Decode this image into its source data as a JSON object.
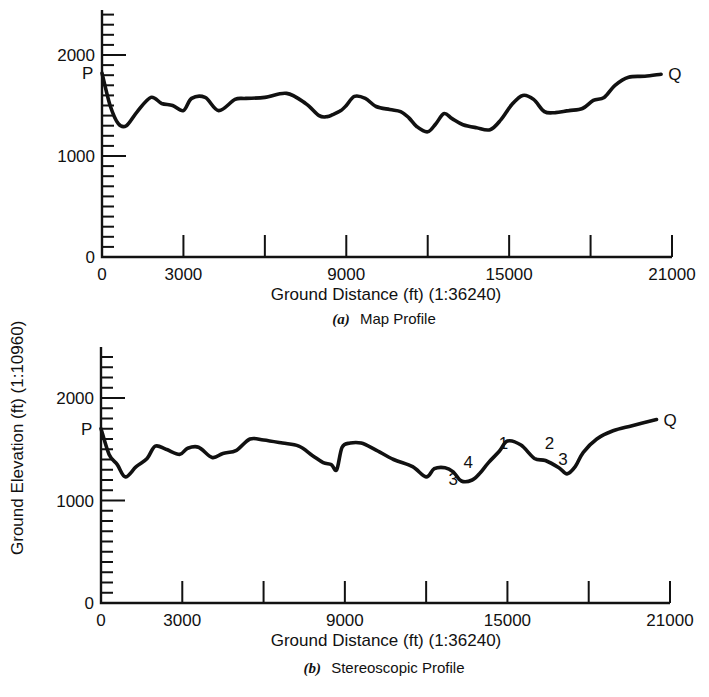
{
  "y_axis_title": "Ground Elevation (ft) (1:10960)",
  "chart_data": [
    {
      "type": "line",
      "panel": "a",
      "caption_letter": "(a)",
      "caption_text": "Map Profile",
      "xlabel": "Ground Distance (ft) (1:36240)",
      "ylabel": "Ground Elevation (ft) (1:10960)",
      "xlim": [
        0,
        21000
      ],
      "ylim": [
        0,
        2400
      ],
      "x_tick_labels": [
        "0",
        "3000",
        "9000",
        "15000",
        "21000"
      ],
      "x_tick_label_values": [
        0,
        3000,
        9000,
        15000,
        21000
      ],
      "x_major_ticks": [
        3000,
        6000,
        9000,
        12000,
        15000,
        18000,
        21000
      ],
      "y_tick_labels": [
        "0",
        "1000",
        "2000"
      ],
      "y_tick_label_values": [
        0,
        1000,
        2000
      ],
      "y_minor_step": 100,
      "grid": false,
      "start_label": "P",
      "end_label": "Q",
      "annotations": [],
      "x": [
        0,
        300,
        600,
        900,
        1300,
        1800,
        2200,
        2600,
        3000,
        3300,
        3800,
        4300,
        4900,
        5300,
        6000,
        6800,
        7500,
        8000,
        8300,
        8500,
        8800,
        9000,
        9300,
        9700,
        10100,
        10600,
        11000,
        11300,
        11600,
        12000,
        12300,
        12600,
        12900,
        13300,
        13800,
        14300,
        14700,
        15100,
        15500,
        15900,
        16300,
        16700,
        17200,
        17700,
        18100,
        18500,
        18900,
        19400,
        20000,
        20600
      ],
      "y": [
        1820,
        1500,
        1320,
        1300,
        1440,
        1580,
        1520,
        1500,
        1450,
        1570,
        1580,
        1450,
        1560,
        1570,
        1580,
        1620,
        1520,
        1400,
        1390,
        1410,
        1450,
        1500,
        1590,
        1570,
        1490,
        1460,
        1440,
        1380,
        1290,
        1240,
        1320,
        1420,
        1370,
        1310,
        1280,
        1260,
        1360,
        1510,
        1600,
        1560,
        1440,
        1430,
        1450,
        1470,
        1550,
        1580,
        1700,
        1780,
        1790,
        1810
      ]
    },
    {
      "type": "line",
      "panel": "b",
      "caption_letter": "(b)",
      "caption_text": "Stereoscopic Profile",
      "xlabel": "Ground Distance (ft) (1:36240)",
      "ylabel": "Ground Elevation (ft) (1:10960)",
      "xlim": [
        0,
        21000
      ],
      "ylim": [
        0,
        2400
      ],
      "x_tick_labels": [
        "0",
        "3000",
        "9000",
        "15000",
        "21000"
      ],
      "x_tick_label_values": [
        0,
        3000,
        9000,
        15000,
        21000
      ],
      "x_major_ticks": [
        3000,
        6000,
        9000,
        12000,
        15000,
        18000,
        21000
      ],
      "y_tick_labels": [
        "0",
        "1000",
        "2000"
      ],
      "y_tick_label_values": [
        0,
        1000,
        2000
      ],
      "y_minor_step": 100,
      "grid": false,
      "start_label": "P",
      "end_label": "Q",
      "annotations": [
        {
          "text": "3",
          "x": 13000,
          "y": 1150
        },
        {
          "text": "4",
          "x": 13550,
          "y": 1320
        },
        {
          "text": "1",
          "x": 14850,
          "y": 1500
        },
        {
          "text": "2",
          "x": 16550,
          "y": 1500
        },
        {
          "text": "3",
          "x": 17050,
          "y": 1350
        }
      ],
      "x": [
        0,
        300,
        600,
        900,
        1300,
        1700,
        2000,
        2400,
        2900,
        3200,
        3600,
        4100,
        4500,
        5000,
        5500,
        6000,
        6700,
        7300,
        7800,
        8200,
        8500,
        8700,
        8900,
        9200,
        9600,
        10100,
        10800,
        11500,
        12000,
        12300,
        12700,
        13000,
        13300,
        13700,
        14000,
        14300,
        14700,
        15000,
        15500,
        16000,
        16400,
        16900,
        17200,
        17500,
        17800,
        18300,
        18900,
        19600,
        20500
      ],
      "y": [
        1700,
        1450,
        1350,
        1230,
        1330,
        1410,
        1530,
        1500,
        1450,
        1510,
        1520,
        1420,
        1460,
        1490,
        1600,
        1590,
        1560,
        1530,
        1440,
        1370,
        1350,
        1300,
        1520,
        1560,
        1560,
        1500,
        1400,
        1330,
        1230,
        1310,
        1320,
        1280,
        1190,
        1200,
        1270,
        1370,
        1480,
        1580,
        1540,
        1410,
        1390,
        1320,
        1260,
        1330,
        1470,
        1600,
        1680,
        1730,
        1790
      ]
    }
  ]
}
